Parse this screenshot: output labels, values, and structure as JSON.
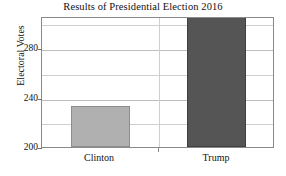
{
  "chart_data": {
    "type": "bar",
    "title": "Results of Presidential Election 2016",
    "xlabel": "",
    "ylabel": "Electoral Votes",
    "categories": [
      "Clinton",
      "Trump"
    ],
    "values": [
      233,
      306
    ],
    "ylim": [
      200,
      306
    ],
    "yticks": [
      200,
      240,
      280
    ],
    "ytick_labels": [
      "200",
      "240",
      "280"
    ],
    "minor_gridlines": [
      220,
      260,
      300
    ],
    "grid": true,
    "legend": "none",
    "series": [
      {
        "name": "Electoral Votes",
        "values": [
          233,
          306
        ]
      }
    ],
    "bar_colors": [
      "#b0b0b0",
      "#555555"
    ],
    "frame_color": "#8a8a8a",
    "grid_color": "#cfcfcf",
    "text_color": "#111111"
  }
}
